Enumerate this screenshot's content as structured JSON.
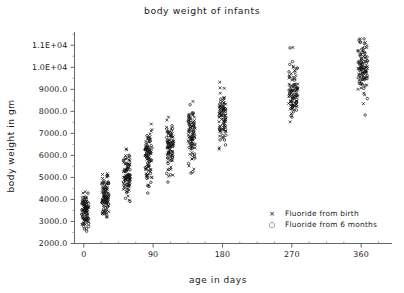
{
  "figure": {
    "width": 404,
    "height": 293,
    "background": "#ffffff",
    "foreground": "#1a1a1a"
  },
  "chart_data": {
    "type": "scatter",
    "title": "body weight of infants",
    "xlabel": "age in days",
    "ylabel": "body weight in gm",
    "xlim": [
      -12,
      400
    ],
    "ylim": [
      2000,
      11600
    ],
    "grid": false,
    "legend_position": "lower-right",
    "xticks": [
      0,
      90,
      180,
      270,
      360
    ],
    "xticklabels": [
      "0",
      "90",
      "180",
      "270",
      "360"
    ],
    "x_minor_tick_interval": 22.5,
    "yticks": [
      2000,
      3000,
      4000,
      5000,
      6000,
      7000,
      8000,
      9000,
      10000,
      11000
    ],
    "yticklabels": [
      "2000.0",
      "3000.0",
      "4000.0",
      "5000.0",
      "6000.0",
      "7000.0",
      "8000.0",
      "9000.0",
      "1.0E+04",
      "1.1E+04"
    ],
    "y_minor_tick_interval": 500,
    "marker_colors": {
      "x": "#111111",
      "o": "#111111"
    },
    "series": [
      {
        "name": "Fluoride from birth",
        "marker": "x",
        "legend_glyph": "×"
      },
      {
        "name": "Fluoride from 6 months",
        "marker": "o",
        "legend_glyph": "○"
      }
    ],
    "clusters": [
      {
        "age": 2,
        "n": 95,
        "center": 3450,
        "spread": 520,
        "min": 2380,
        "max": 4450
      },
      {
        "age": 28,
        "n": 92,
        "center": 4180,
        "spread": 470,
        "min": 3080,
        "max": 5180
      },
      {
        "age": 56,
        "n": 88,
        "center": 5120,
        "spread": 520,
        "min": 3760,
        "max": 6850
      },
      {
        "age": 84,
        "n": 90,
        "center": 5950,
        "spread": 600,
        "min": 4180,
        "max": 7700
      },
      {
        "age": 112,
        "n": 88,
        "center": 6400,
        "spread": 610,
        "min": 4600,
        "max": 8680
      },
      {
        "age": 140,
        "n": 90,
        "center": 6950,
        "spread": 640,
        "min": 5140,
        "max": 9200
      },
      {
        "age": 180,
        "n": 86,
        "center": 7700,
        "spread": 640,
        "min": 5800,
        "max": 9450
      },
      {
        "age": 272,
        "n": 96,
        "center": 8950,
        "spread": 700,
        "min": 6750,
        "max": 11050
      },
      {
        "age": 362,
        "n": 104,
        "center": 9950,
        "spread": 660,
        "min": 7500,
        "max": 11450
      }
    ]
  },
  "legend": {
    "entries": [
      {
        "glyph": "×",
        "label": "Fluoride from birth"
      },
      {
        "glyph": "○",
        "label": "Fluoride from 6 months"
      }
    ]
  }
}
